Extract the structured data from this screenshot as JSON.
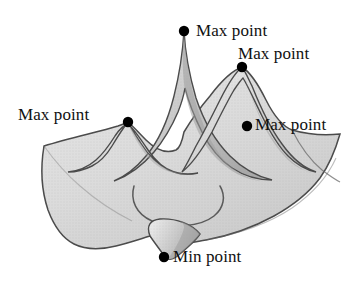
{
  "figure": {
    "background_color": "#ffffff",
    "surface_fill_color": "#dcdcdc",
    "surface_shade_color": "#b4b4b4",
    "surface_outline_color": "#4a4a4a",
    "marker_color": "#000000",
    "text_color": "#111111"
  },
  "labels": {
    "max_top": "Max point",
    "max_right": "Max point",
    "max_left": "Max point",
    "max_mid": "Max point",
    "min_bottom": "Min point"
  },
  "markers": [
    {
      "name": "max-point-top",
      "label": "Max point",
      "x": 184,
      "y": 31
    },
    {
      "name": "max-point-right",
      "label": "Max point",
      "x": 242,
      "y": 67
    },
    {
      "name": "max-point-left",
      "label": "Max point",
      "x": 128,
      "y": 122
    },
    {
      "name": "max-point-mid",
      "label": "Max point",
      "x": 247,
      "y": 126
    },
    {
      "name": "min-point-bottom",
      "label": "Min point",
      "x": 164,
      "y": 257
    }
  ]
}
